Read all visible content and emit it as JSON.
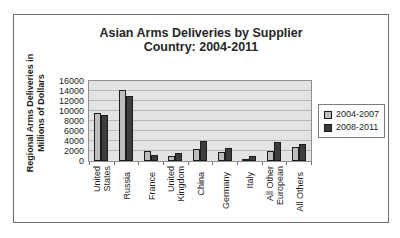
{
  "figure": {
    "title_lines": [
      "Asian Arms Deliveries by Supplier",
      "Country: 2004-2011"
    ],
    "y_axis_title_lines": [
      "Regional Arms Deliveries in",
      "Millions of Dollars"
    ]
  },
  "legend": {
    "items": [
      {
        "label": "2004-2007",
        "color": "#bdbdbd"
      },
      {
        "label": "2008-2011",
        "color": "#3d3d3d"
      }
    ]
  },
  "chart_data": {
    "type": "bar",
    "title": "Asian Arms Deliveries by Supplier Country: 2004-2011",
    "xlabel": "",
    "ylabel": "Regional Arms Deliveries in Millions of Dollars",
    "categories": [
      "United States",
      "Russia",
      "France",
      "United Kingdom",
      "China",
      "Germany",
      "Italy",
      "All Other European",
      "All Others"
    ],
    "category_label_lines": [
      [
        "United",
        "States"
      ],
      [
        "Russia"
      ],
      [
        "France"
      ],
      [
        "United",
        "Kingdom"
      ],
      [
        "China"
      ],
      [
        "Germany"
      ],
      [
        "Italy"
      ],
      [
        "All Other",
        "European"
      ],
      [
        "All Others"
      ]
    ],
    "series": [
      {
        "name": "2004-2007",
        "color": "#bdbdbd",
        "values": [
          9700,
          14200,
          2000,
          1000,
          2500,
          1800,
          300,
          2000,
          2900
        ]
      },
      {
        "name": "2008-2011",
        "color": "#3d3d3d",
        "values": [
          9200,
          13100,
          1200,
          1700,
          4100,
          2700,
          1000,
          3800,
          3500
        ]
      }
    ],
    "ylim": [
      0,
      16000
    ],
    "ytick_step": 2000,
    "ytick_labels": [
      "0",
      "2000",
      "4000",
      "6000",
      "8000",
      "10000",
      "12000",
      "14000",
      "16000"
    ],
    "grid": true,
    "legend_position": "right",
    "plot_background": "#e3e3e3",
    "gridline_color": "#b6b6b6",
    "bar_border_color": "#1c1c1c"
  }
}
